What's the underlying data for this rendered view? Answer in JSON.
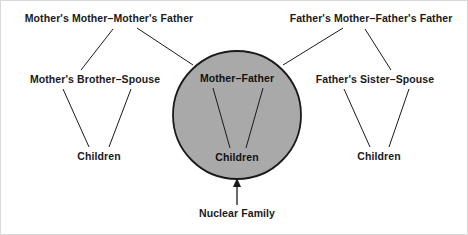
{
  "diagram": {
    "title_visible": false,
    "type": "kinship-diagram",
    "background_color": "#ffffff",
    "circle": {
      "name": "nuclear-family-circle",
      "fill_color": "#a9a9a9",
      "stroke_color": "#1a1a1a",
      "center_x": 236,
      "center_y": 114,
      "radius": 64
    },
    "labels": {
      "mothers_parents": "Mother's Mother–Mother's Father",
      "fathers_parents": "Father's Mother–Father's Father",
      "mothers_brother": "Mother's Brother–Spouse",
      "fathers_sister": "Father's Sister–Spouse",
      "left_children": "Children",
      "right_children": "Children",
      "center_couple": "Mother–Father",
      "center_children": "Children",
      "callout": "Nuclear Family"
    },
    "nodes": [
      {
        "id": "mothers_parents",
        "label": "Mother's Mother–Mother's Father",
        "x": 108,
        "y": 18
      },
      {
        "id": "fathers_parents",
        "label": "Father's Mother–Father's Father",
        "x": 370,
        "y": 18
      },
      {
        "id": "mothers_brother",
        "label": "Mother's Brother–Spouse",
        "x": 94,
        "y": 79
      },
      {
        "id": "fathers_sister",
        "label": "Father's Sister–Spouse",
        "x": 374,
        "y": 79
      },
      {
        "id": "left_children",
        "label": "Children",
        "x": 98,
        "y": 156
      },
      {
        "id": "right_children",
        "label": "Children",
        "x": 378,
        "y": 156
      },
      {
        "id": "center_couple",
        "label": "Mother–Father",
        "x": 236,
        "y": 78
      },
      {
        "id": "center_children",
        "label": "Children",
        "x": 236,
        "y": 157
      },
      {
        "id": "callout",
        "label": "Nuclear Family",
        "x": 236,
        "y": 213
      }
    ],
    "edges": [
      {
        "from": "mothers_parents",
        "to": "mothers_brother",
        "x1": 112,
        "y1": 28,
        "x2": 80,
        "y2": 69
      },
      {
        "from": "mothers_parents",
        "to": "nuclear-family-circle",
        "x1": 136,
        "y1": 27,
        "x2": 190,
        "y2": 63
      },
      {
        "from": "fathers_parents",
        "to": "fathers_sister",
        "x1": 364,
        "y1": 28,
        "x2": 390,
        "y2": 69
      },
      {
        "from": "fathers_parents",
        "to": "nuclear-family-circle",
        "x1": 342,
        "y1": 27,
        "x2": 283,
        "y2": 63
      },
      {
        "from": "mothers_brother",
        "to": "left_children",
        "x1": 62,
        "y1": 88,
        "x2": 88,
        "y2": 146
      },
      {
        "from": "mothers_brother",
        "to": "left_children",
        "x1": 128,
        "y1": 88,
        "x2": 107,
        "y2": 146
      },
      {
        "from": "fathers_sister",
        "to": "right_children",
        "x1": 344,
        "y1": 88,
        "x2": 369,
        "y2": 146
      },
      {
        "from": "fathers_sister",
        "to": "right_children",
        "x1": 406,
        "y1": 88,
        "x2": 387,
        "y2": 146
      },
      {
        "from": "center_couple",
        "to": "center_children",
        "x1": 212,
        "y1": 87,
        "x2": 228,
        "y2": 147
      },
      {
        "from": "center_couple",
        "to": "center_children",
        "x1": 262,
        "y1": 87,
        "x2": 245,
        "y2": 147
      }
    ],
    "arrow": {
      "name": "nuclear-family-arrow",
      "from_x": 236,
      "from_y": 203,
      "to_x": 236,
      "to_y": 179
    }
  }
}
